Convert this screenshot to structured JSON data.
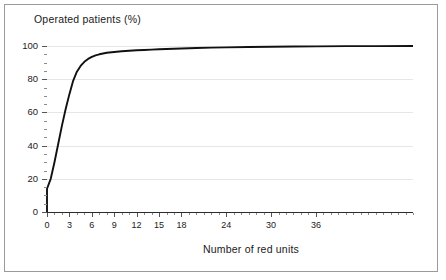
{
  "figure": {
    "title": "Operated patients  (%)",
    "background_color": "#ffffff",
    "frame_color": "#9a9a9a",
    "curve_color": "#111111",
    "grid_color": "#e6e6e6"
  },
  "chart_data": {
    "type": "line",
    "title": "Operated patients  (%)",
    "xlabel": "Number of red units",
    "ylabel": "Operated patients  (%)",
    "xlim": [
      0,
      49
    ],
    "ylim": [
      0,
      105
    ],
    "grid": "horizontal",
    "legend": "none",
    "x_ticks": [
      0,
      3,
      6,
      9,
      12,
      15,
      18,
      24,
      30,
      36
    ],
    "x_tick_labels": [
      "0",
      "3",
      "6",
      "9",
      "12",
      "15",
      "18",
      "24",
      "30",
      "36"
    ],
    "x_minor_tick_step": 1,
    "y_ticks": [
      0,
      20,
      40,
      60,
      80,
      100
    ],
    "y_tick_labels": [
      "0",
      "20",
      "40",
      "60",
      "80",
      "100"
    ],
    "y_minor_tick_step": 5,
    "series": [
      {
        "name": "Operated patients",
        "x": [
          0,
          0,
          0.5,
          1,
          1.5,
          2,
          2.5,
          3,
          3.5,
          4,
          4.5,
          5,
          5.5,
          6,
          6.5,
          7,
          7.5,
          8,
          9,
          10,
          11,
          12,
          13,
          14,
          15,
          16,
          18,
          20,
          22,
          24,
          27,
          30,
          33,
          36,
          40,
          44,
          49
        ],
        "values": [
          0,
          14,
          20,
          30,
          41,
          52,
          62,
          71,
          79,
          84.5,
          88,
          90.5,
          92.2,
          93.4,
          94.3,
          95,
          95.5,
          95.9,
          96.4,
          96.8,
          97.1,
          97.4,
          97.6,
          97.8,
          98,
          98.2,
          98.5,
          98.8,
          99,
          99.2,
          99.4,
          99.55,
          99.7,
          99.8,
          99.9,
          99.95,
          100
        ]
      }
    ]
  },
  "axis": {
    "x_caption": "Number of red units"
  }
}
